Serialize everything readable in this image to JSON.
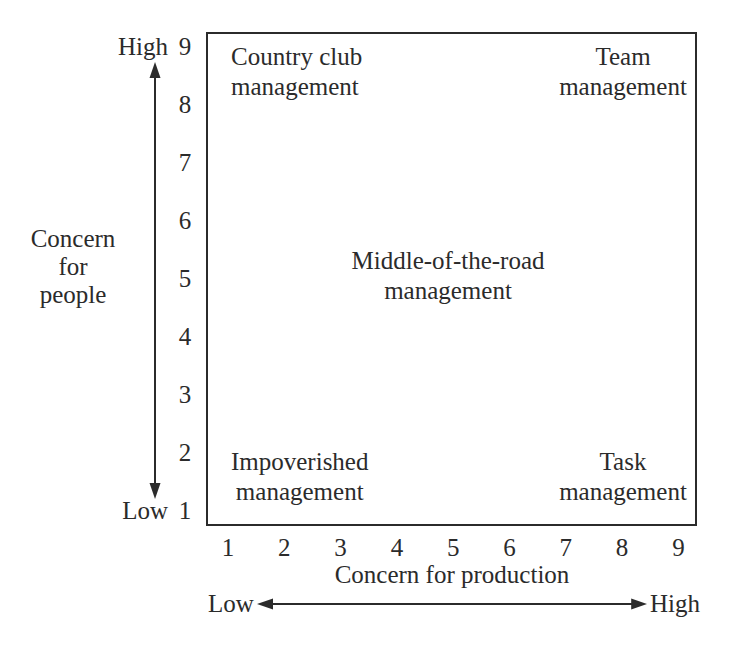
{
  "colors": {
    "ink": "#2b2b2b",
    "background": "#ffffff"
  },
  "grid": {
    "quadrants": [
      {
        "name": "country-club",
        "lines": [
          "Country club",
          "management"
        ]
      },
      {
        "name": "team",
        "lines": [
          "Team",
          "management"
        ]
      },
      {
        "name": "middle-of-the-road",
        "lines": [
          "Middle-of-the-road",
          "management"
        ]
      },
      {
        "name": "impoverished",
        "lines": [
          "Impoverished",
          "management"
        ]
      },
      {
        "name": "task",
        "lines": [
          "Task",
          "management"
        ]
      }
    ]
  },
  "y_axis": {
    "title_lines": [
      "Concern",
      "for",
      "people"
    ],
    "high_word": "High",
    "low_word": "Low",
    "ticks": [
      "9",
      "8",
      "7",
      "6",
      "5",
      "4",
      "3",
      "2",
      "1"
    ]
  },
  "x_axis": {
    "title": "Concern for production",
    "low_word": "Low",
    "high_word": "High",
    "ticks": [
      "1",
      "2",
      "3",
      "4",
      "5",
      "6",
      "7",
      "8",
      "9"
    ]
  }
}
